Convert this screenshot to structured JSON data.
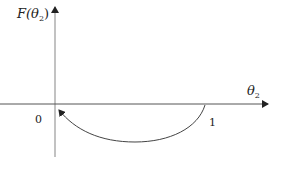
{
  "diagram": {
    "y_axis_label": {
      "main": "F(θ",
      "sub": "2",
      "close": ")"
    },
    "x_axis_label": {
      "main": "θ",
      "sub": "2"
    },
    "tick_labels": {
      "origin": "0",
      "one": "1"
    },
    "curve": {
      "description": "arc from θ2=1 below axis back to θ2=0 with arrowhead at 0",
      "start": "1",
      "end": "0"
    },
    "colors": {
      "axis": "#888888",
      "curve": "#444444",
      "text": "#222222"
    }
  }
}
